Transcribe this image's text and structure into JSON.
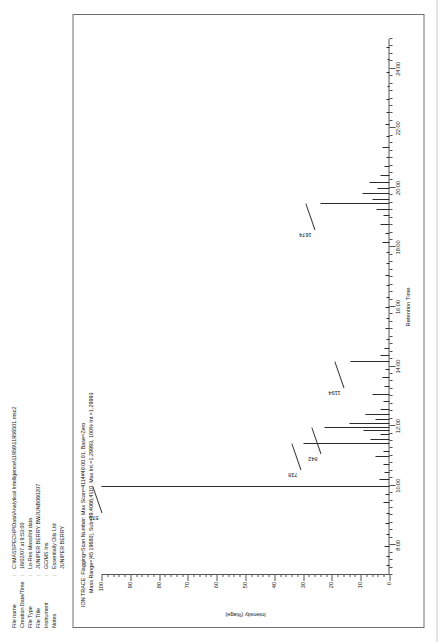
{
  "metadata": {
    "rows": [
      {
        "label": "File name",
        "sep": ":",
        "value": "C:\\MASSPECHP\\Data\\Analytical Intelligence\\11956\\11956501.msc2"
      },
      {
        "label": "Creation Date/Time",
        "sep": ":",
        "value": "16/02/07 at 9:53:00"
      },
      {
        "label": "File Type",
        "sep": ":",
        "value": "Lo-Res Mass/Int data"
      },
      {
        "label": "File Title",
        "sep": ":",
        "value": "JUNIPER BERRY BWJUNB060207"
      },
      {
        "label": "Instrument",
        "sep": ":",
        "value": "GC/MS Ins"
      },
      {
        "label": "Notes",
        "sep": ":",
        "value": "Essentially Oils Ltd"
      },
      {
        "label": "",
        "sep": "",
        "value": "JUNIPER BERRY"
      }
    ]
  },
  "chart_data": {
    "type": "line",
    "title": "ION TRACE: Flagging=Scan Number: Max Scan=4114#40:00.01. Base=Zero",
    "subtitle": "Mass Range=[45 19680], Sub=39.4066,4110. Max Int.=1.29993, 100% Int.=1.29993",
    "xlabel": "Retention Time",
    "ylabel": "Intensity (%age)",
    "xlim": [
      7.0,
      25.0
    ],
    "ylim": [
      0,
      100
    ],
    "grid": false,
    "legend": null,
    "xticks": [
      "8:00",
      "10:00",
      "12:00",
      "14:00",
      "16:00",
      "18:00",
      "20:00",
      "22:00",
      "24:00"
    ],
    "xtick_values": [
      8,
      10,
      12,
      14,
      16,
      18,
      20,
      22,
      24
    ],
    "yticks": [
      0,
      10,
      20,
      30,
      40,
      50,
      60,
      70,
      80,
      90,
      100
    ],
    "annotations": [
      {
        "label": "579",
        "x": 9.95,
        "y": 100
      },
      {
        "label": "738",
        "x": 11.4,
        "y": 31
      },
      {
        "label": "842",
        "x": 11.95,
        "y": 24
      },
      {
        "label": "1194",
        "x": 14.15,
        "y": 16
      },
      {
        "label": "1674",
        "x": 19.45,
        "y": 26
      }
    ],
    "peaks": [
      {
        "x": 7.3,
        "y": 1.2
      },
      {
        "x": 7.62,
        "y": 1.0
      },
      {
        "x": 7.95,
        "y": 1.6
      },
      {
        "x": 8.35,
        "y": 1.1
      },
      {
        "x": 8.72,
        "y": 1.4
      },
      {
        "x": 9.05,
        "y": 1.0
      },
      {
        "x": 9.42,
        "y": 2.0
      },
      {
        "x": 9.7,
        "y": 1.3
      },
      {
        "x": 9.95,
        "y": 100.0
      },
      {
        "x": 10.18,
        "y": 3.4
      },
      {
        "x": 10.42,
        "y": 1.6
      },
      {
        "x": 10.7,
        "y": 2.2
      },
      {
        "x": 10.95,
        "y": 4.8
      },
      {
        "x": 11.12,
        "y": 2.0
      },
      {
        "x": 11.4,
        "y": 30.0
      },
      {
        "x": 11.52,
        "y": 6.5
      },
      {
        "x": 11.7,
        "y": 3.1
      },
      {
        "x": 11.82,
        "y": 9.0
      },
      {
        "x": 11.95,
        "y": 22.5
      },
      {
        "x": 12.08,
        "y": 14.0
      },
      {
        "x": 12.2,
        "y": 5.0
      },
      {
        "x": 12.38,
        "y": 8.5
      },
      {
        "x": 12.55,
        "y": 3.0
      },
      {
        "x": 12.8,
        "y": 2.2
      },
      {
        "x": 13.05,
        "y": 6.0
      },
      {
        "x": 13.3,
        "y": 1.8
      },
      {
        "x": 13.6,
        "y": 2.4
      },
      {
        "x": 13.9,
        "y": 1.5
      },
      {
        "x": 14.15,
        "y": 13.5
      },
      {
        "x": 14.35,
        "y": 3.0
      },
      {
        "x": 14.6,
        "y": 1.6
      },
      {
        "x": 14.9,
        "y": 1.2
      },
      {
        "x": 15.25,
        "y": 1.5
      },
      {
        "x": 15.6,
        "y": 1.0
      },
      {
        "x": 15.95,
        "y": 1.3
      },
      {
        "x": 16.3,
        "y": 0.9
      },
      {
        "x": 16.7,
        "y": 1.1
      },
      {
        "x": 17.05,
        "y": 1.4
      },
      {
        "x": 17.45,
        "y": 0.9
      },
      {
        "x": 17.8,
        "y": 1.2
      },
      {
        "x": 18.15,
        "y": 2.6
      },
      {
        "x": 18.45,
        "y": 1.5
      },
      {
        "x": 18.75,
        "y": 3.2
      },
      {
        "x": 19.05,
        "y": 2.0
      },
      {
        "x": 19.25,
        "y": 4.5
      },
      {
        "x": 19.45,
        "y": 24.0
      },
      {
        "x": 19.6,
        "y": 6.0
      },
      {
        "x": 19.78,
        "y": 9.5
      },
      {
        "x": 19.95,
        "y": 4.0
      },
      {
        "x": 20.15,
        "y": 6.8
      },
      {
        "x": 20.4,
        "y": 3.0
      },
      {
        "x": 20.7,
        "y": 1.8
      },
      {
        "x": 21.0,
        "y": 1.2
      },
      {
        "x": 21.35,
        "y": 2.4
      },
      {
        "x": 21.7,
        "y": 1.0
      },
      {
        "x": 22.1,
        "y": 1.3
      },
      {
        "x": 22.5,
        "y": 0.9
      },
      {
        "x": 22.95,
        "y": 1.1
      },
      {
        "x": 23.4,
        "y": 0.8
      },
      {
        "x": 23.85,
        "y": 1.0
      },
      {
        "x": 24.3,
        "y": 0.7
      },
      {
        "x": 24.7,
        "y": 0.9
      }
    ]
  }
}
